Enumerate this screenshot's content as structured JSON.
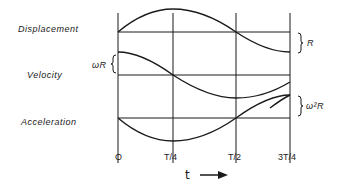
{
  "diagram": {
    "row_labels": {
      "displacement": "Displacement",
      "velocity": "Velocity",
      "acceleration": "Acceleration"
    },
    "amplitude_labels": {
      "displacement": "R",
      "velocity": "ωR",
      "acceleration": "ω²R"
    },
    "x_ticks": [
      "O",
      "T/4",
      "T/2",
      "3T/4"
    ],
    "x_axis_label": "t",
    "arrow_icon": "right-arrow-icon",
    "colors": {
      "ink": "#1a1a1a",
      "background": "#ffffff"
    }
  }
}
